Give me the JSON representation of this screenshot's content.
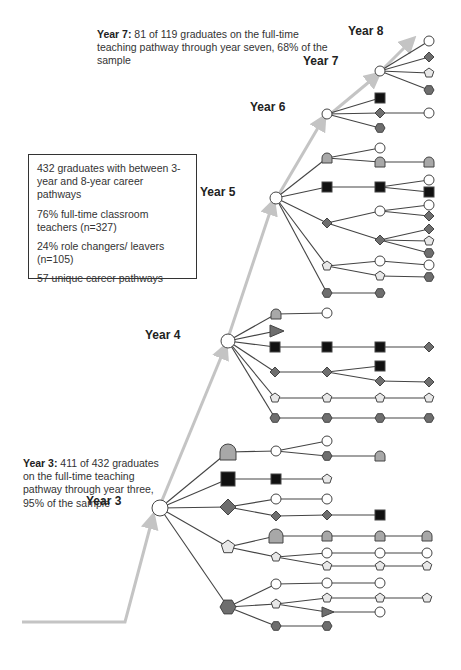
{
  "annotations": {
    "year7": {
      "bold": "Year 7:",
      "text": " 81 of 119 graduates on the full-time teaching pathway through year seven, 68% of the sample"
    },
    "year3": {
      "bold": "Year 3:",
      "text": " 411 of 432 graduates on the full-time teaching pathway through year three, 95% of the sample"
    }
  },
  "summary_box": {
    "lines": [
      "432 graduates with between 3-year and 8-year career pathways",
      "76% full-time classroom teachers (n=327)",
      "24% role changers/ leavers (n=105)",
      "57 unique career pathways"
    ]
  },
  "year_labels": [
    {
      "label": "Year 3",
      "x": 116,
      "y": 502
    },
    {
      "label": "Year 4",
      "x": 175,
      "y": 336
    },
    {
      "label": "Year 5",
      "x": 230,
      "y": 193
    },
    {
      "label": "Year 6",
      "x": 280,
      "y": 108
    },
    {
      "label": "Year 7",
      "x": 333,
      "y": 62
    },
    {
      "label": "Year 8",
      "x": 378,
      "y": 32
    }
  ],
  "colors": {
    "edge": "#444444",
    "arrow": "#c4c4c4",
    "outline": "#444444",
    "circle_fill": "#ffffff",
    "diamond_fill": "#6e6e6e",
    "hexagon_fill": "#6e6e6e",
    "square_fill": "#111111",
    "pentagon_fill": "#e8e8e8",
    "dome_fill": "#a8a8a8",
    "triangle_fill": "#6e6e6e"
  },
  "legend_shapes": {
    "circle": "full-time classroom teacher",
    "square": "role shape",
    "diamond": "role shape",
    "pentagon": "role shape",
    "hexagon": "role shape",
    "dome": "role shape",
    "triangle": "role shape"
  },
  "main_arrow": [
    [
      22,
      622
    ],
    [
      125,
      622
    ],
    [
      152,
      520
    ],
    [
      232,
      347
    ],
    [
      275,
      205
    ],
    [
      320,
      120
    ],
    [
      368,
      75
    ],
    [
      410,
      40
    ]
  ],
  "hubs": [
    {
      "id": "y3",
      "x": 160,
      "y": 508,
      "r": 8
    },
    {
      "id": "y4",
      "x": 228,
      "y": 341,
      "r": 7
    },
    {
      "id": "y5",
      "x": 276,
      "y": 198,
      "r": 6
    },
    {
      "id": "y6",
      "x": 327,
      "y": 114,
      "r": 5
    },
    {
      "id": "y7",
      "x": 380,
      "y": 71,
      "r": 5
    }
  ],
  "nodes": [
    {
      "id": "a1",
      "s": "dome",
      "x": 228,
      "y": 452,
      "r": 8
    },
    {
      "id": "a2",
      "s": "circle",
      "x": 276,
      "y": 451,
      "r": 5
    },
    {
      "id": "a3",
      "s": "circle",
      "x": 327,
      "y": 441,
      "r": 5
    },
    {
      "id": "a4",
      "s": "hexagon",
      "x": 327,
      "y": 456,
      "r": 5
    },
    {
      "id": "a5",
      "s": "dome",
      "x": 380,
      "y": 456,
      "r": 5
    },
    {
      "id": "b1",
      "s": "square",
      "x": 228,
      "y": 479,
      "r": 7
    },
    {
      "id": "b2",
      "s": "square",
      "x": 276,
      "y": 479,
      "r": 5
    },
    {
      "id": "b3",
      "s": "pentagon",
      "x": 327,
      "y": 479,
      "r": 5
    },
    {
      "id": "c1",
      "s": "diamond",
      "x": 228,
      "y": 507,
      "r": 8
    },
    {
      "id": "c2",
      "s": "circle",
      "x": 276,
      "y": 499,
      "r": 5
    },
    {
      "id": "c3",
      "s": "circle",
      "x": 327,
      "y": 499,
      "r": 5
    },
    {
      "id": "c4",
      "s": "diamond",
      "x": 276,
      "y": 516,
      "r": 5
    },
    {
      "id": "c5",
      "s": "diamond",
      "x": 327,
      "y": 515,
      "r": 5
    },
    {
      "id": "c6",
      "s": "square",
      "x": 380,
      "y": 515,
      "r": 5
    },
    {
      "id": "d1",
      "s": "pentagon",
      "x": 228,
      "y": 547,
      "r": 7
    },
    {
      "id": "d2",
      "s": "dome",
      "x": 276,
      "y": 536,
      "r": 7
    },
    {
      "id": "d3",
      "s": "dome",
      "x": 327,
      "y": 536,
      "r": 5
    },
    {
      "id": "d4",
      "s": "dome",
      "x": 380,
      "y": 536,
      "r": 5
    },
    {
      "id": "d5",
      "s": "dome",
      "x": 427,
      "y": 536,
      "r": 5
    },
    {
      "id": "d6",
      "s": "pentagon",
      "x": 276,
      "y": 557,
      "r": 5
    },
    {
      "id": "d7",
      "s": "circle",
      "x": 327,
      "y": 553,
      "r": 5
    },
    {
      "id": "d8",
      "s": "circle",
      "x": 380,
      "y": 553,
      "r": 5
    },
    {
      "id": "d9",
      "s": "circle",
      "x": 427,
      "y": 553,
      "r": 5
    },
    {
      "id": "d10",
      "s": "pentagon",
      "x": 327,
      "y": 566,
      "r": 5
    },
    {
      "id": "d11",
      "s": "pentagon",
      "x": 380,
      "y": 566,
      "r": 5
    },
    {
      "id": "d12",
      "s": "pentagon",
      "x": 427,
      "y": 566,
      "r": 5
    },
    {
      "id": "e1",
      "s": "hexagon",
      "x": 228,
      "y": 607,
      "r": 8
    },
    {
      "id": "e2",
      "s": "circle",
      "x": 276,
      "y": 584,
      "r": 5
    },
    {
      "id": "e3",
      "s": "circle",
      "x": 327,
      "y": 583,
      "r": 5
    },
    {
      "id": "e4",
      "s": "circle",
      "x": 380,
      "y": 583,
      "r": 5
    },
    {
      "id": "e5",
      "s": "pentagon",
      "x": 276,
      "y": 604,
      "r": 5
    },
    {
      "id": "e6",
      "s": "pentagon",
      "x": 327,
      "y": 598,
      "r": 5
    },
    {
      "id": "e7",
      "s": "pentagon",
      "x": 380,
      "y": 598,
      "r": 5
    },
    {
      "id": "e8",
      "s": "pentagon",
      "x": 427,
      "y": 598,
      "r": 5
    },
    {
      "id": "e9",
      "s": "triangle",
      "x": 327,
      "y": 612,
      "r": 5
    },
    {
      "id": "e10",
      "s": "circle",
      "x": 380,
      "y": 612,
      "r": 5
    },
    {
      "id": "e11",
      "s": "hexagon",
      "x": 276,
      "y": 626,
      "r": 5
    },
    {
      "id": "e12",
      "s": "hexagon",
      "x": 327,
      "y": 626,
      "r": 5
    },
    {
      "id": "f1",
      "s": "dome",
      "x": 276,
      "y": 314,
      "r": 5
    },
    {
      "id": "f2",
      "s": "circle",
      "x": 327,
      "y": 313,
      "r": 5
    },
    {
      "id": "f3",
      "s": "triangle",
      "x": 276,
      "y": 331,
      "r": 6
    },
    {
      "id": "f4",
      "s": "square",
      "x": 275,
      "y": 347,
      "r": 5
    },
    {
      "id": "f5",
      "s": "square",
      "x": 327,
      "y": 347,
      "r": 5
    },
    {
      "id": "f6",
      "s": "square",
      "x": 380,
      "y": 347,
      "r": 5
    },
    {
      "id": "f7",
      "s": "diamond",
      "x": 429,
      "y": 347,
      "r": 5
    },
    {
      "id": "f8",
      "s": "diamond",
      "x": 275,
      "y": 372,
      "r": 5
    },
    {
      "id": "f9",
      "s": "diamond",
      "x": 327,
      "y": 372,
      "r": 5
    },
    {
      "id": "f10",
      "s": "square",
      "x": 380,
      "y": 366,
      "r": 5
    },
    {
      "id": "f11",
      "s": "diamond",
      "x": 380,
      "y": 381,
      "r": 5
    },
    {
      "id": "f12",
      "s": "diamond",
      "x": 429,
      "y": 382,
      "r": 5
    },
    {
      "id": "f13",
      "s": "pentagon",
      "x": 275,
      "y": 398,
      "r": 5
    },
    {
      "id": "f14",
      "s": "pentagon",
      "x": 327,
      "y": 398,
      "r": 5
    },
    {
      "id": "f15",
      "s": "pentagon",
      "x": 380,
      "y": 398,
      "r": 5
    },
    {
      "id": "f16",
      "s": "pentagon",
      "x": 429,
      "y": 398,
      "r": 5
    },
    {
      "id": "f17",
      "s": "hexagon",
      "x": 275,
      "y": 418,
      "r": 5
    },
    {
      "id": "f18",
      "s": "hexagon",
      "x": 327,
      "y": 418,
      "r": 5
    },
    {
      "id": "f19",
      "s": "hexagon",
      "x": 380,
      "y": 418,
      "r": 5
    },
    {
      "id": "f20",
      "s": "hexagon",
      "x": 429,
      "y": 418,
      "r": 5
    },
    {
      "id": "g1",
      "s": "dome",
      "x": 327,
      "y": 158,
      "r": 5
    },
    {
      "id": "g2",
      "s": "circle",
      "x": 380,
      "y": 148,
      "r": 5
    },
    {
      "id": "g3",
      "s": "dome",
      "x": 380,
      "y": 162,
      "r": 5
    },
    {
      "id": "g4",
      "s": "dome",
      "x": 429,
      "y": 162,
      "r": 5
    },
    {
      "id": "g5",
      "s": "square",
      "x": 327,
      "y": 187,
      "r": 5
    },
    {
      "id": "g6",
      "s": "square",
      "x": 380,
      "y": 187,
      "r": 5
    },
    {
      "id": "g7",
      "s": "circle",
      "x": 429,
      "y": 180,
      "r": 5
    },
    {
      "id": "g8",
      "s": "square",
      "x": 429,
      "y": 192,
      "r": 5
    },
    {
      "id": "g9",
      "s": "diamond",
      "x": 327,
      "y": 223,
      "r": 5
    },
    {
      "id": "g10",
      "s": "circle",
      "x": 380,
      "y": 211,
      "r": 5
    },
    {
      "id": "g11",
      "s": "circle",
      "x": 429,
      "y": 205,
      "r": 5
    },
    {
      "id": "g12",
      "s": "diamond",
      "x": 429,
      "y": 216,
      "r": 5
    },
    {
      "id": "g13",
      "s": "diamond",
      "x": 380,
      "y": 240,
      "r": 5
    },
    {
      "id": "g14",
      "s": "diamond",
      "x": 429,
      "y": 229,
      "r": 5
    },
    {
      "id": "g15",
      "s": "pentagon",
      "x": 429,
      "y": 241,
      "r": 5
    },
    {
      "id": "g16",
      "s": "hexagon",
      "x": 429,
      "y": 253,
      "r": 5
    },
    {
      "id": "g17",
      "s": "pentagon",
      "x": 327,
      "y": 266,
      "r": 5
    },
    {
      "id": "g18",
      "s": "circle",
      "x": 380,
      "y": 261,
      "r": 5
    },
    {
      "id": "g19",
      "s": "circle",
      "x": 429,
      "y": 265,
      "r": 5
    },
    {
      "id": "g20",
      "s": "pentagon",
      "x": 380,
      "y": 276,
      "r": 5
    },
    {
      "id": "g21",
      "s": "hexagon",
      "x": 429,
      "y": 277,
      "r": 5
    },
    {
      "id": "g22",
      "s": "hexagon",
      "x": 327,
      "y": 293,
      "r": 5
    },
    {
      "id": "g23",
      "s": "hexagon",
      "x": 380,
      "y": 293,
      "r": 5
    },
    {
      "id": "h1",
      "s": "square",
      "x": 380,
      "y": 98,
      "r": 5
    },
    {
      "id": "h2",
      "s": "diamond",
      "x": 380,
      "y": 113,
      "r": 5
    },
    {
      "id": "h3",
      "s": "circle",
      "x": 429,
      "y": 113,
      "r": 5
    },
    {
      "id": "h4",
      "s": "hexagon",
      "x": 380,
      "y": 128,
      "r": 5
    },
    {
      "id": "h5",
      "s": "hexagon",
      "x": 429,
      "y": 90,
      "r": 5
    },
    {
      "id": "i1",
      "s": "circle",
      "x": 429,
      "y": 41,
      "r": 5
    },
    {
      "id": "i2",
      "s": "diamond",
      "x": 429,
      "y": 57,
      "r": 5
    },
    {
      "id": "i3",
      "s": "pentagon",
      "x": 429,
      "y": 73,
      "r": 5
    }
  ],
  "edges": [
    [
      "y3",
      "a1"
    ],
    [
      "a1",
      "a2"
    ],
    [
      "a2",
      "a3"
    ],
    [
      "a2",
      "a4"
    ],
    [
      "a4",
      "a5"
    ],
    [
      "y3",
      "b1"
    ],
    [
      "b1",
      "b2"
    ],
    [
      "b2",
      "b3"
    ],
    [
      "y3",
      "c1"
    ],
    [
      "c1",
      "c2"
    ],
    [
      "c2",
      "c3"
    ],
    [
      "c1",
      "c4"
    ],
    [
      "c4",
      "c5"
    ],
    [
      "c5",
      "c6"
    ],
    [
      "y3",
      "d1"
    ],
    [
      "d1",
      "d2"
    ],
    [
      "d2",
      "d3"
    ],
    [
      "d3",
      "d4"
    ],
    [
      "d4",
      "d5"
    ],
    [
      "d1",
      "d6"
    ],
    [
      "d6",
      "d7"
    ],
    [
      "d7",
      "d8"
    ],
    [
      "d8",
      "d9"
    ],
    [
      "d6",
      "d10"
    ],
    [
      "d10",
      "d11"
    ],
    [
      "d11",
      "d12"
    ],
    [
      "y3",
      "e1"
    ],
    [
      "e1",
      "e2"
    ],
    [
      "e2",
      "e3"
    ],
    [
      "e3",
      "e4"
    ],
    [
      "e1",
      "e5"
    ],
    [
      "e5",
      "e6"
    ],
    [
      "e6",
      "e7"
    ],
    [
      "e7",
      "e8"
    ],
    [
      "e5",
      "e9"
    ],
    [
      "e9",
      "e10"
    ],
    [
      "e1",
      "e11"
    ],
    [
      "e11",
      "e12"
    ],
    [
      "y4",
      "f1"
    ],
    [
      "f1",
      "f2"
    ],
    [
      "y4",
      "f3"
    ],
    [
      "y4",
      "f4"
    ],
    [
      "f4",
      "f5"
    ],
    [
      "f5",
      "f6"
    ],
    [
      "f6",
      "f7"
    ],
    [
      "y4",
      "f8"
    ],
    [
      "f8",
      "f9"
    ],
    [
      "f9",
      "f10"
    ],
    [
      "f9",
      "f11"
    ],
    [
      "f11",
      "f12"
    ],
    [
      "y4",
      "f13"
    ],
    [
      "f13",
      "f14"
    ],
    [
      "f14",
      "f15"
    ],
    [
      "f15",
      "f16"
    ],
    [
      "y4",
      "f17"
    ],
    [
      "f17",
      "f18"
    ],
    [
      "f18",
      "f19"
    ],
    [
      "f19",
      "f20"
    ],
    [
      "y5",
      "g1"
    ],
    [
      "g1",
      "g2"
    ],
    [
      "g1",
      "g3"
    ],
    [
      "g3",
      "g4"
    ],
    [
      "y5",
      "g5"
    ],
    [
      "g5",
      "g6"
    ],
    [
      "g6",
      "g7"
    ],
    [
      "g6",
      "g8"
    ],
    [
      "y5",
      "g9"
    ],
    [
      "g9",
      "g10"
    ],
    [
      "g10",
      "g11"
    ],
    [
      "g10",
      "g12"
    ],
    [
      "g9",
      "g13"
    ],
    [
      "g13",
      "g14"
    ],
    [
      "g13",
      "g15"
    ],
    [
      "g13",
      "g16"
    ],
    [
      "y5",
      "g17"
    ],
    [
      "g17",
      "g18"
    ],
    [
      "g18",
      "g19"
    ],
    [
      "g17",
      "g20"
    ],
    [
      "g20",
      "g21"
    ],
    [
      "y5",
      "g22"
    ],
    [
      "g22",
      "g23"
    ],
    [
      "y6",
      "h1"
    ],
    [
      "y6",
      "h2"
    ],
    [
      "h2",
      "h3"
    ],
    [
      "y6",
      "h4"
    ],
    [
      "y7",
      "i1"
    ],
    [
      "y7",
      "i2"
    ],
    [
      "y7",
      "i3"
    ],
    [
      "y7",
      "h5"
    ]
  ]
}
